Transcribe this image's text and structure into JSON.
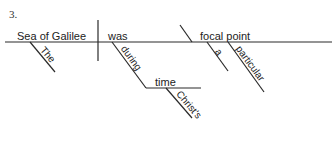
{
  "problem_number": "3.",
  "diagram": {
    "type": "sentence-diagram",
    "baseline": {
      "subject": "Sea of Galilee",
      "verb": "was",
      "predicate_nominative": "focal point"
    },
    "modifiers": {
      "subject_modifier": "The",
      "verb_preposition": "during",
      "prepositional_object": "time",
      "object_modifier": "Christ's",
      "pn_modifier_1": "a",
      "pn_modifier_2": "particular"
    }
  },
  "colors": {
    "line": "#2a2a2a",
    "text": "#222222"
  }
}
